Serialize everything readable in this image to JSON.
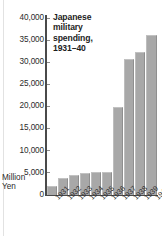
{
  "figure": {
    "background_color": "#ffffff",
    "bar_color": "#a8a8a8",
    "axis_color": "#4a4a4a",
    "text_color": "#2b2b2b"
  },
  "title_lines": [
    "Japanese",
    "military",
    "spending,",
    "1931–40"
  ],
  "axis": {
    "unit_line_1": "Million",
    "unit_line_2": "Yen",
    "zero_label": "0",
    "y_ticks": [
      "40,000",
      "35,000",
      "30,000",
      "25,000",
      "20,000",
      "15,000",
      "10,000",
      "5,000"
    ]
  },
  "chart_data": {
    "type": "bar",
    "title": "Japanese military spending, 1931–40",
    "xlabel": "",
    "ylabel": "Million Yen",
    "ylim": [
      0,
      40000
    ],
    "ytick_values": [
      0,
      5000,
      10000,
      15000,
      20000,
      25000,
      30000,
      35000,
      40000
    ],
    "ytick_labels": [
      "0",
      "5,000",
      "10,000",
      "15,000",
      "20,000",
      "25,000",
      "30,000",
      "35,000",
      "40,000"
    ],
    "grid": false,
    "legend": null,
    "categories": [
      "1931",
      "1932",
      "1933",
      "1934",
      "1935",
      "1936",
      "1937",
      "1938",
      "1939",
      "1940"
    ],
    "values": [
      2000,
      3800,
      4500,
      4900,
      5100,
      5300,
      19800,
      30800,
      32300,
      36200
    ]
  }
}
